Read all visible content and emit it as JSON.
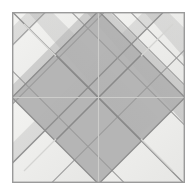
{
  "artwork": {
    "title": "Diagonal Diamond Quilt Block",
    "type": "geometric-tile-pattern",
    "canvas": {
      "width": 196,
      "height": 196,
      "background": "#ffffff"
    },
    "frame": {
      "name": "outer-frame",
      "x": 12,
      "y": 12,
      "width": 173,
      "height": 171,
      "border_color": "#9a9a9a",
      "border_width": 1.4,
      "inner_fill": "#f2f2f0"
    },
    "palette": {
      "background_white": "#ffffff",
      "panel_light": "#f1f1ef",
      "corner_triangle": "#ececeb",
      "band_gray": "#b3b3b3",
      "band_gray_light": "#bdbdbd",
      "band_gray_dark": "#a3a3a3",
      "seam_line": "#8c8c8c",
      "seam_line_faint": "#cfcfcf",
      "frame_border": "#9a9a9a",
      "highlight": "#d9d9d7"
    },
    "geometry": {
      "center": {
        "x": 98.5,
        "y": 97.5
      },
      "diamond_half_width": 86,
      "diamond_half_height": 85,
      "band_count_per_diagonal": 3,
      "band_spacing": 29,
      "seam_stroke_width": 1.1
    },
    "elements": [
      {
        "name": "outer-frame",
        "label": "Outer square frame"
      },
      {
        "name": "central-diamond",
        "label": "Central gray diamond"
      },
      {
        "name": "corner-triangle-top-left",
        "label": "Top-left white corner triangle"
      },
      {
        "name": "corner-triangle-top-right",
        "label": "Top-right white corner triangle"
      },
      {
        "name": "corner-triangle-bottom-left",
        "label": "Bottom-left white corner triangle"
      },
      {
        "name": "corner-triangle-bottom-right",
        "label": "Bottom-right white corner triangle"
      },
      {
        "name": "diagonal-band-group",
        "label": "Diagonal seam bands"
      },
      {
        "name": "center-x-crossing",
        "label": "Center X crossing point"
      },
      {
        "name": "vertical-center-seam",
        "label": "Vertical center seam"
      },
      {
        "name": "horizontal-center-seam",
        "label": "Horizontal center seam"
      }
    ]
  }
}
